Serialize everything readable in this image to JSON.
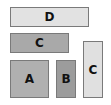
{
  "diagram": {
    "boxes": [
      {
        "id": "box-d",
        "label": "D",
        "x": 10,
        "y": 7,
        "w": 79,
        "h": 20,
        "fill": "#e2e2e2"
      },
      {
        "id": "box-c-horizontal",
        "label": "C",
        "x": 10,
        "y": 33,
        "w": 59,
        "h": 20,
        "fill": "#a9a9a9"
      },
      {
        "id": "box-a",
        "label": "A",
        "x": 10,
        "y": 60,
        "w": 39,
        "h": 38,
        "fill": "#b0b0b0"
      },
      {
        "id": "box-b",
        "label": "B",
        "x": 56,
        "y": 60,
        "w": 20,
        "h": 38,
        "fill": "#9c9c9c"
      },
      {
        "id": "box-c-vertical",
        "label": "C",
        "x": 83,
        "y": 41,
        "w": 20,
        "h": 57,
        "fill": "#e0e0e0"
      }
    ]
  }
}
